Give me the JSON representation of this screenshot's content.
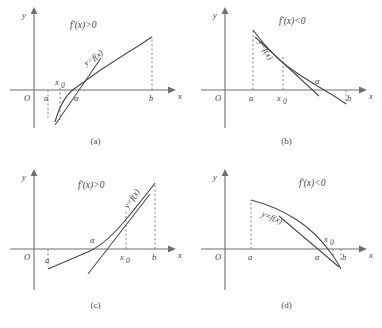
{
  "figure": {
    "axis_labels": {
      "x": "x",
      "y": "y",
      "origin": "O"
    }
  },
  "panels": [
    {
      "id": "a",
      "caption": "(a)",
      "condition": "f'(x)>0",
      "curve_label": "y=f(x)",
      "ticks": [
        "a",
        "x",
        "α",
        "b"
      ],
      "tick_a": "a",
      "tick_x0": "x",
      "tick_x0_sub": "0",
      "tick_alpha": "α",
      "tick_b": "b"
    },
    {
      "id": "b",
      "caption": "(b)",
      "condition": "f'(x)<0",
      "curve_label": "y=f(x)",
      "tick_a": "a",
      "tick_x0": "x",
      "tick_x0_sub": "0",
      "tick_alpha": "α",
      "tick_b": "b"
    },
    {
      "id": "c",
      "caption": "(c)",
      "condition": "f'(x)>0",
      "curve_label": "y=f(x)",
      "tick_a": "a",
      "tick_x0": "x",
      "tick_x0_sub": "0",
      "tick_alpha": "α",
      "tick_b": "b"
    },
    {
      "id": "d",
      "caption": "(d)",
      "condition": "f'(x)<0",
      "curve_label": "y=f(x)",
      "tick_a": "a",
      "tick_x0": "x",
      "tick_x0_sub": "0",
      "tick_alpha": "α",
      "tick_b": "b"
    }
  ],
  "colors": {
    "axis": "#6f6f6f",
    "curve": "#4a4a4a",
    "dash": "#7a7a7a",
    "text": "#3f3f3f",
    "background": "#ffffff"
  }
}
